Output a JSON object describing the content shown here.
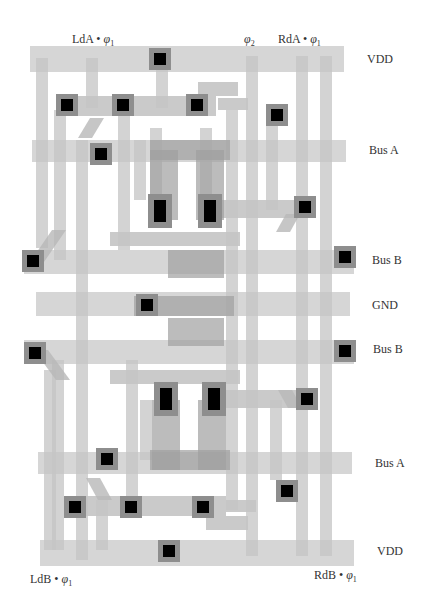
{
  "top_labels": {
    "lda": {
      "text": "LdA • ",
      "phi": "φ",
      "sub": "1"
    },
    "phi2": {
      "text": "",
      "phi": "φ",
      "sub": "2"
    },
    "rda": {
      "text": "RdA • ",
      "phi": "φ",
      "sub": "1"
    }
  },
  "bottom_labels": {
    "ldb": {
      "text": "LdB • ",
      "phi": "φ",
      "sub": "1"
    },
    "rdb": {
      "text": "RdB • ",
      "phi": "φ",
      "sub": "1"
    }
  },
  "rail_labels": {
    "vdd_top": "VDD",
    "bus_a_top": "Bus A",
    "bus_b_top": "Bus B",
    "gnd": "GND",
    "bus_b_bottom": "Bus B",
    "bus_a_bottom": "Bus A",
    "vdd_bottom": "VDD"
  },
  "colors": {
    "background": "#ffffff",
    "layer_light": "#d4d4d4",
    "layer_mid": "#b4b4b4",
    "overlap": "#9a9a9a",
    "contact_pad": "#8c8c8c",
    "contact": "#000000"
  }
}
